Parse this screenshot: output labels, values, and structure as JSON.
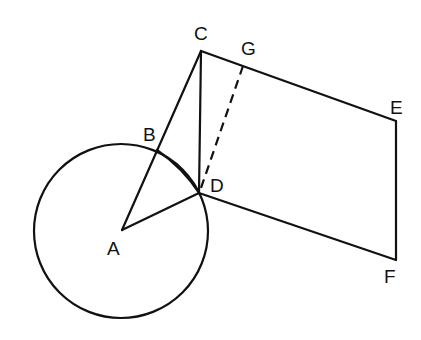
{
  "diagram": {
    "title": "",
    "stroke_color": "#111111",
    "background": "#ffffff",
    "points": {
      "A": {
        "label": "A",
        "x": 122,
        "y": 230
      },
      "B": {
        "label": "B",
        "x": 157,
        "y": 150
      },
      "C": {
        "label": "C",
        "x": 201,
        "y": 51
      },
      "D": {
        "label": "D",
        "x": 199,
        "y": 193
      },
      "E": {
        "label": "E",
        "x": 396,
        "y": 121
      },
      "F": {
        "label": "F",
        "x": 396,
        "y": 260
      },
      "G": {
        "label": "G",
        "x": 243,
        "y": 66
      }
    },
    "circle": {
      "center": "A",
      "radius": 87
    },
    "segments": [
      {
        "from": "A",
        "to": "C",
        "style": "solid"
      },
      {
        "from": "A",
        "to": "D",
        "style": "solid"
      },
      {
        "from": "B",
        "to": "D",
        "style": "solid"
      },
      {
        "from": "C",
        "to": "D",
        "style": "solid"
      },
      {
        "from": "C",
        "to": "E",
        "style": "solid"
      },
      {
        "from": "E",
        "to": "F",
        "style": "solid"
      },
      {
        "from": "D",
        "to": "F",
        "style": "solid"
      },
      {
        "from": "G",
        "to": "D",
        "style": "dashed"
      }
    ],
    "labels": {
      "A": "A",
      "B": "B",
      "C": "C",
      "D": "D",
      "E": "E",
      "F": "F",
      "G": "G"
    }
  }
}
